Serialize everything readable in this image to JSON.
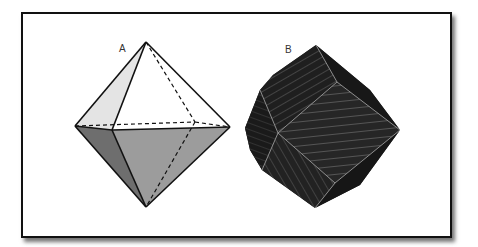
{
  "figure": {
    "panels": [
      {
        "label": "A",
        "shape": "octahedron",
        "style": "shaded wireframe with dashed hidden edges",
        "colors": {
          "upper_left_face": "#e4e4e4",
          "upper_front_face": "#ffffff",
          "lower_left_face": "#6e6e6e",
          "lower_front_face": "#9c9c9c",
          "edge": "#111111"
        }
      },
      {
        "label": "B",
        "shape": "rhombic dodecahedron",
        "style": "dark faces with light hatching lines",
        "colors": {
          "face": "#1f1f1f",
          "hatch": "#8a8a8a",
          "edge": "#9a9a9a"
        }
      }
    ]
  }
}
